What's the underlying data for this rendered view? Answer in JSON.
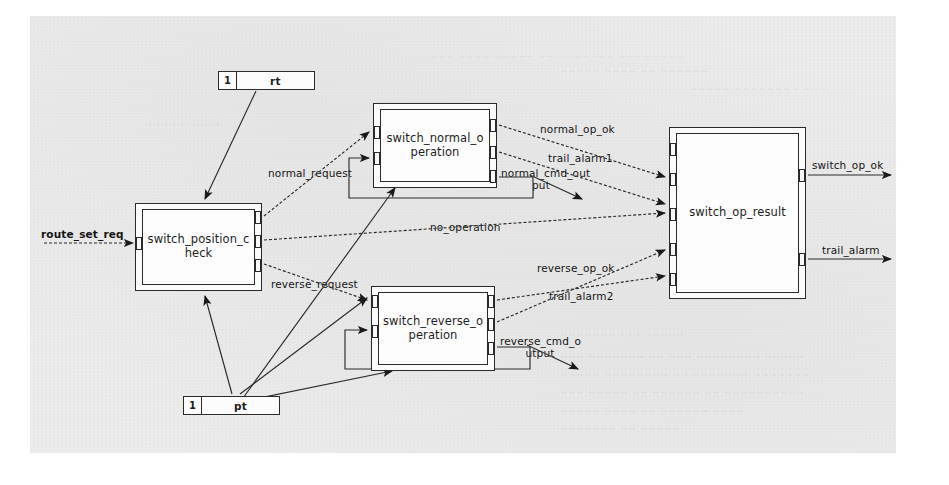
{
  "diagram": {
    "type": "block-diagram",
    "background_color": "#eeeeee",
    "line_color": "#2a2a2a",
    "blocks": [
      {
        "id": "switch_position_check",
        "label": "switch_position_check",
        "label_line1": "switch_position_c",
        "label_line2": "heck",
        "x": 135,
        "y": 203,
        "w": 127,
        "h": 88,
        "inputs": 1,
        "outputs": 3
      },
      {
        "id": "switch_normal_operation",
        "label": "switch_normal_operation",
        "label_line1": "switch_normal_o",
        "label_line2": "peration",
        "x": 373,
        "y": 103,
        "w": 124,
        "h": 85,
        "inputs": 3,
        "outputs": 3
      },
      {
        "id": "switch_reverse_operation",
        "label": "switch_reverse_operation",
        "label_line1": "switch_reverse_o",
        "label_line2": "peration",
        "x": 371,
        "y": 286,
        "w": 124,
        "h": 85,
        "inputs": 3,
        "outputs": 3
      },
      {
        "id": "switch_op_result",
        "label": "switch_op_result",
        "label_line1": "switch_op_result",
        "label_line2": "",
        "x": 669,
        "y": 127,
        "w": 137,
        "h": 172,
        "inputs": 5,
        "outputs": 2
      }
    ],
    "constants": [
      {
        "id": "rt",
        "number": "1",
        "name": "rt",
        "x": 218,
        "y": 71,
        "w": 97,
        "h": 19
      },
      {
        "id": "pt",
        "number": "1",
        "name": "pt",
        "x": 183,
        "y": 396,
        "w": 97,
        "h": 19
      }
    ],
    "signals": [
      {
        "id": "route_set_req",
        "label": "route_set_req",
        "x": 41,
        "y": 228,
        "kind": "external-input"
      },
      {
        "id": "normal_request",
        "label": "normal_request",
        "x": 268,
        "y": 167,
        "kind": "internal"
      },
      {
        "id": "no_operation",
        "label": "no_operation",
        "x": 430,
        "y": 221,
        "kind": "internal"
      },
      {
        "id": "reverse_request",
        "label": "reverse_request",
        "x": 271,
        "y": 278,
        "kind": "internal"
      },
      {
        "id": "normal_op_ok",
        "label": "normal_op_ok",
        "x": 540,
        "y": 123,
        "kind": "internal"
      },
      {
        "id": "trail_alarm1",
        "label": "trail_alarm1",
        "x": 548,
        "y": 152,
        "kind": "internal"
      },
      {
        "id": "normal_cmd_output",
        "label": "normal_cmd_output",
        "line1": "normal_cmd_out",
        "line2": "put",
        "x": 501,
        "y": 168,
        "kind": "internal"
      },
      {
        "id": "reverse_op_ok",
        "label": "reverse_op_ok",
        "x": 537,
        "y": 262,
        "kind": "internal"
      },
      {
        "id": "trail_alarm2",
        "label": "trail_alarm2",
        "x": 549,
        "y": 290,
        "kind": "internal"
      },
      {
        "id": "reverse_cmd_output",
        "label": "reverse_cmd_output",
        "line1": "reverse_cmd_o",
        "line2": "utput",
        "x": 500,
        "y": 336,
        "kind": "internal"
      },
      {
        "id": "switch_op_ok",
        "label": "switch_op_ok",
        "x": 812,
        "y": 159,
        "kind": "external-output"
      },
      {
        "id": "trail_alarm",
        "label": "trail_alarm",
        "x": 822,
        "y": 244,
        "kind": "external-output"
      }
    ],
    "ghost_text": [
      {
        "text": "~~~ ~~~~ ~~~~~ ~~ ~~~~~~~ ~~~~~~~~",
        "x": 430,
        "y": 52
      },
      {
        "text": "~~~~~ ~~~~ ~~ ~~~~~~",
        "x": 560,
        "y": 66
      },
      {
        "text": "~~~~~ ~~~~~~~~ ~~~",
        "x": 690,
        "y": 84
      },
      {
        "text": "~~~~~~~~~~ ~~~~~",
        "x": 560,
        "y": 330
      },
      {
        "text": "~~~ ~~~~~~~ ~~ ~~~ ~~~~~~~~ ~~~~~",
        "x": 560,
        "y": 352
      },
      {
        "text": "~~~~~ ~~~~~~~~ ~~ ~~~~~~~ ~~~~~~~",
        "x": 560,
        "y": 370
      },
      {
        "text": "~~~ ~~~~~ ~~ ~~~~~~ ~~ ~~~~~~~~~~",
        "x": 560,
        "y": 388
      },
      {
        "text": "~~~~~ ~~~~ ~~ ~~~~~~ ~~~~",
        "x": 560,
        "y": 406
      },
      {
        "text": "~~~~~~~ ~~ ~~~~~",
        "x": 560,
        "y": 424
      },
      {
        "text": "~~~~~ ~~~~",
        "x": 145,
        "y": 120
      },
      {
        "text": "~~~~ ~~~~~~",
        "x": 690,
        "y": 222
      },
      {
        "text": "~~~~~~",
        "x": 700,
        "y": 255
      }
    ]
  }
}
